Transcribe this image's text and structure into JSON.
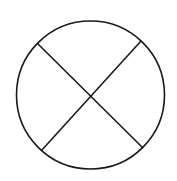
{
  "diagram": {
    "stroke_color": "#1a1a1a",
    "background": "#ffffff",
    "circle": {
      "cx": 90.5,
      "cy": 95,
      "r": 74
    },
    "lines": [
      {
        "x1": 37,
        "y1": 43,
        "x2": 143,
        "y2": 148
      },
      {
        "x1": 141,
        "y1": 41,
        "x2": 41,
        "y2": 151
      }
    ]
  }
}
